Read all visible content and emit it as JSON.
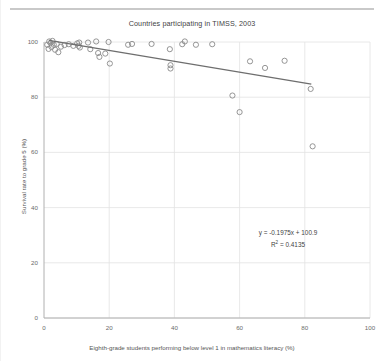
{
  "page": {
    "top_rule": "horizontal-rule"
  },
  "chart_data": {
    "type": "scatter",
    "title": "Countries participating in TIMSS, 2003",
    "xlabel": "Eighth-grade students performing below level 1 in mathematics literacy (%)",
    "ylabel": "Survival rate to grade 5 (%)",
    "xlim": [
      0,
      100
    ],
    "ylim": [
      0,
      100
    ],
    "xticks": [
      0,
      20,
      40,
      60,
      80,
      100
    ],
    "yticks": [
      0,
      20,
      40,
      60,
      80,
      100
    ],
    "grid": true,
    "legend": "none",
    "marker": "open-circle",
    "marker_color": "#8a8a8a",
    "trendline_color": "#6e6e6e",
    "annotations": {
      "equation": "y = -0.1975x + 100.9",
      "r_squared_label": "R",
      "r_squared_exponent": "2",
      "r_squared_value": " = 0.4135"
    },
    "trendline": {
      "slope": -0.1975,
      "intercept": 100.9,
      "x_start": 1.5,
      "x_end": 82.0
    },
    "points": [
      {
        "x": 1.0,
        "y": 99.0
      },
      {
        "x": 1.4,
        "y": 97.5
      },
      {
        "x": 1.6,
        "y": 100.2
      },
      {
        "x": 2.0,
        "y": 99.6
      },
      {
        "x": 2.3,
        "y": 98.2
      },
      {
        "x": 2.6,
        "y": 100.4
      },
      {
        "x": 3.0,
        "y": 99.0
      },
      {
        "x": 3.4,
        "y": 97.2
      },
      {
        "x": 3.9,
        "y": 99.3
      },
      {
        "x": 4.4,
        "y": 96.3
      },
      {
        "x": 5.2,
        "y": 98.3
      },
      {
        "x": 6.3,
        "y": 98.9
      },
      {
        "x": 7.6,
        "y": 99.2
      },
      {
        "x": 9.0,
        "y": 98.6
      },
      {
        "x": 10.2,
        "y": 99.5
      },
      {
        "x": 10.6,
        "y": 98.6
      },
      {
        "x": 10.8,
        "y": 99.8
      },
      {
        "x": 11.0,
        "y": 98.0
      },
      {
        "x": 13.5,
        "y": 99.8
      },
      {
        "x": 14.2,
        "y": 97.4
      },
      {
        "x": 16.0,
        "y": 100.2
      },
      {
        "x": 16.6,
        "y": 96.0
      },
      {
        "x": 17.0,
        "y": 94.6
      },
      {
        "x": 18.8,
        "y": 95.8
      },
      {
        "x": 19.8,
        "y": 100.0
      },
      {
        "x": 20.2,
        "y": 92.2
      },
      {
        "x": 25.8,
        "y": 99.0
      },
      {
        "x": 27.0,
        "y": 99.3
      },
      {
        "x": 33.0,
        "y": 99.3
      },
      {
        "x": 38.6,
        "y": 97.4
      },
      {
        "x": 38.8,
        "y": 91.6
      },
      {
        "x": 38.8,
        "y": 90.4
      },
      {
        "x": 42.4,
        "y": 99.2
      },
      {
        "x": 43.2,
        "y": 100.2
      },
      {
        "x": 46.6,
        "y": 99.0
      },
      {
        "x": 51.6,
        "y": 99.2
      },
      {
        "x": 57.8,
        "y": 80.6
      },
      {
        "x": 60.0,
        "y": 74.6
      },
      {
        "x": 63.2,
        "y": 93.0
      },
      {
        "x": 67.8,
        "y": 90.6
      },
      {
        "x": 73.8,
        "y": 93.2
      },
      {
        "x": 81.8,
        "y": 83.0
      },
      {
        "x": 82.4,
        "y": 62.2
      }
    ]
  }
}
